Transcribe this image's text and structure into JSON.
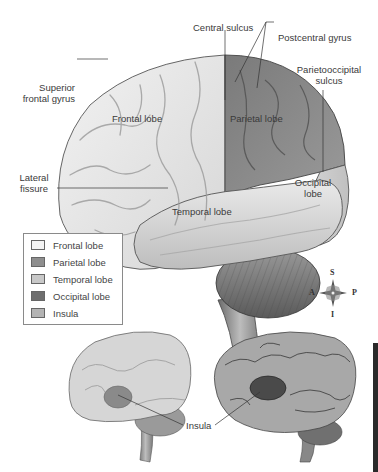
{
  "diagram": {
    "labels": {
      "central_sulcus": "Central sulcus",
      "postcentral_gyrus": "Postcentral gyrus",
      "parietooccipital_sulcus_1": "Parietooccipital",
      "parietooccipital_sulcus_2": "sulcus",
      "superior_frontal_gyrus_1": "Superior",
      "superior_frontal_gyrus_2": "frontal gyrus",
      "frontal_lobe": "Frontal lobe",
      "parietal_lobe": "Parietal lobe",
      "lateral_fissure_1": "Lateral",
      "lateral_fissure_2": "fissure",
      "occipital_lobe_1": "Occipital",
      "occipital_lobe_2": "lobe",
      "temporal_lobe": "Temporal lobe",
      "insula": "Insula"
    },
    "legend": [
      {
        "label": "Frontal lobe",
        "color": "#f4f4f4"
      },
      {
        "label": "Parietal lobe",
        "color": "#8e8e8e"
      },
      {
        "label": "Temporal lobe",
        "color": "#c8c8c8"
      },
      {
        "label": "Occipital lobe",
        "color": "#6e6e6e"
      },
      {
        "label": "Insula",
        "color": "#b4b4b4"
      }
    ],
    "compass": {
      "superior": "S",
      "inferior": "I",
      "anterior": "A",
      "posterior": "P"
    }
  }
}
